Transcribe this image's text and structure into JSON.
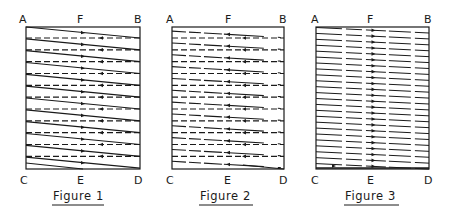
{
  "colors": {
    "ink": "#1a1a1a",
    "background": "#ffffff"
  },
  "figures": [
    {
      "id": "figure-1",
      "caption": "Figure 1",
      "box": {
        "x": 26,
        "y": 27,
        "w": 114,
        "h": 142
      },
      "labels": {
        "top_left": "A",
        "top_mid": "F",
        "top_right": "B",
        "bottom_left": "C",
        "bottom_mid": "E",
        "bottom_right": "D"
      },
      "pattern": "solid-right-dashed-left",
      "rows": 12,
      "solid_arrow_direction": "right",
      "dashed_arrow_direction": "left"
    },
    {
      "id": "figure-2",
      "caption": "Figure 2",
      "box": {
        "x": 172,
        "y": 27,
        "w": 112,
        "h": 142
      },
      "labels": {
        "top_left": "A",
        "top_mid": "F",
        "top_right": "B",
        "bottom_left": "C",
        "bottom_mid": "E",
        "bottom_right": "D"
      },
      "pattern": "solid-left-dashed-left",
      "rows": 12,
      "solid_arrow_direction": "left",
      "dashed_arrow_direction": "left"
    },
    {
      "id": "figure-3",
      "caption": "Figure 3",
      "box": {
        "x": 316,
        "y": 27,
        "w": 113,
        "h": 142
      },
      "labels": {
        "top_left": "A",
        "top_mid": "F",
        "top_right": "B",
        "bottom_left": "C",
        "bottom_mid": "E",
        "bottom_right": "D"
      },
      "pattern": "parallel-broken",
      "rows": 24,
      "solid_arrow_direction": "right"
    }
  ]
}
